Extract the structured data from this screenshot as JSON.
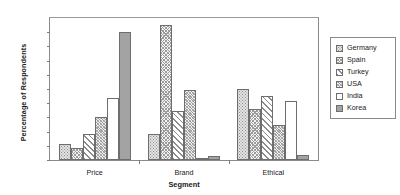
{
  "chart_data": {
    "type": "bar",
    "title": "",
    "xlabel": "Segment",
    "ylabel": "Percentage of Respondents",
    "categories": [
      "Price",
      "Brand",
      "Ethical"
    ],
    "ylim": [
      0,
      50
    ],
    "ytick_labels": [
      "50%",
      "45%",
      "40%",
      "35%",
      "30%",
      "25%",
      "20%",
      "15%",
      "10%",
      "5%",
      "0%"
    ],
    "ytick_values": [
      50,
      45,
      40,
      35,
      30,
      25,
      20,
      15,
      10,
      5,
      0
    ],
    "grid": false,
    "legend_position": "right",
    "series": [
      {
        "name": "Germany",
        "pattern": "light-dots",
        "values": [
          5.5,
          9.2,
          25.0
        ]
      },
      {
        "name": "Spain",
        "pattern": "fine-crosshatch",
        "values": [
          4.3,
          47.5,
          18.0
        ]
      },
      {
        "name": "Turkey",
        "pattern": "diagonal-hatch",
        "values": [
          9.0,
          17.3,
          22.7
        ]
      },
      {
        "name": "USA",
        "pattern": "dense-hatch",
        "values": [
          15.0,
          24.7,
          12.2
        ]
      },
      {
        "name": "India",
        "pattern": "solid-white",
        "values": [
          21.8,
          0.5,
          20.7
        ]
      },
      {
        "name": "Korea",
        "pattern": "solid-gray",
        "values": [
          45.0,
          1.5,
          1.6
        ]
      }
    ]
  },
  "legend": {
    "items": [
      {
        "label": "Germany"
      },
      {
        "label": "Spain"
      },
      {
        "label": "Turkey"
      },
      {
        "label": "USA"
      },
      {
        "label": "India"
      },
      {
        "label": "Korea"
      }
    ]
  }
}
